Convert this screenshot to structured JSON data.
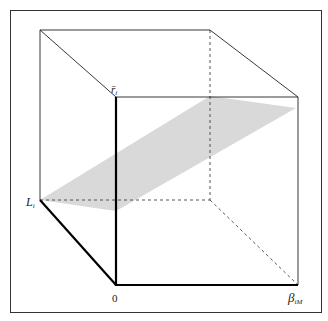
{
  "figure": {
    "type": "3d-cube-diagram",
    "labels": {
      "top_vertical": "r̄",
      "top_vertical_sub": "i",
      "left_depth": "L",
      "left_depth_sub": "i",
      "origin": "0",
      "right_horizontal": "β",
      "right_horizontal_sub": "iM"
    },
    "colors": {
      "frame": "#333333",
      "edges": "#222222",
      "axes": "#000000",
      "plane": "#d9d9d9"
    }
  }
}
